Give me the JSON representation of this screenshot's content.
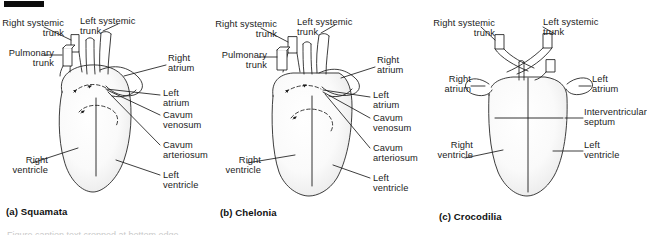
{
  "figure": {
    "type": "anatomical-diagram",
    "background_color": "#ffffff",
    "ink_color": "#1b1b1b",
    "marker_bar_color": "#0c0c0c",
    "chamber_fill": "#fcfcfc",
    "chamber_shade": "#e9e9e9"
  },
  "panels": [
    {
      "id": "a",
      "caption": "(a) Squamata",
      "labels": {
        "right_systemic_trunk": "Right systemic\ntrunk",
        "left_systemic_trunk": "Left systemic\ntrunk",
        "pulmonary_trunk": "Pulmonary\ntrunk",
        "right_atrium": "Right\natrium",
        "left_atrium": "Left\natrium",
        "cavum_venosum": "Cavum\nvenosum",
        "cavum_arteriosum": "Cavum\narteriosum",
        "right_ventricle": "Right\nventricle",
        "left_ventricle": "Left\nventricle"
      }
    },
    {
      "id": "b",
      "caption": "(b) Chelonia",
      "labels": {
        "right_systemic_trunk": "Right systemic\ntrunk",
        "left_systemic_trunk": "Left systemic\ntrunk",
        "pulmonary_trunk": "Pulmonary\ntrunk",
        "right_atrium": "Right\natrium",
        "left_atrium": "Left\natrium",
        "cavum_venosum": "Cavum\nvenosum",
        "cavum_arteriosum": "Cavum\narteriosum",
        "right_ventricle": "Right\nventricle",
        "left_ventricle": "Left\nventricle"
      }
    },
    {
      "id": "c",
      "caption": "(c) Crocodilia",
      "labels": {
        "right_systemic_trunk": "Right systemic\ntrunk",
        "left_systemic_trunk": "Left systemic\ntrunk",
        "right_atrium": "Right\natrium",
        "left_atrium": "Left\natrium",
        "interventricular_septum": "Interventricular\nseptum",
        "right_ventricle": "Right\nventricle",
        "left_ventricle": "Left\nventricle"
      }
    }
  ],
  "cut_text": "Figure caption text cropped at bottom edge"
}
